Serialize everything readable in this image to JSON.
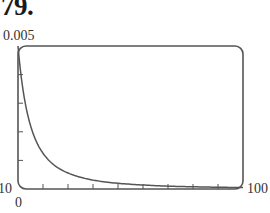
{
  "problem_number": "79.",
  "chart_data": {
    "type": "line",
    "title": "",
    "xlabel": "",
    "ylabel": "",
    "xlim": [
      10,
      100
    ],
    "ylim": [
      0,
      0.005
    ],
    "x_tick_count": 8,
    "y_tick_count": 4,
    "grid": false,
    "legend": null,
    "labels": {
      "y_max": "0.005",
      "y_min": "0",
      "x_min": "10",
      "x_max": "100"
    },
    "series": [
      {
        "name": "curve",
        "x": [
          10,
          12,
          14,
          16,
          18,
          20,
          25,
          30,
          35,
          40,
          50,
          60,
          70,
          80,
          90,
          100
        ],
        "values": [
          0.005,
          0.00347,
          0.00255,
          0.00195,
          0.00154,
          0.00125,
          0.0008,
          0.00056,
          0.00041,
          0.00031,
          0.0002,
          0.00014,
          0.0001,
          7.8e-05,
          6.2e-05,
          5e-05
        ]
      }
    ],
    "color": "#555555"
  }
}
